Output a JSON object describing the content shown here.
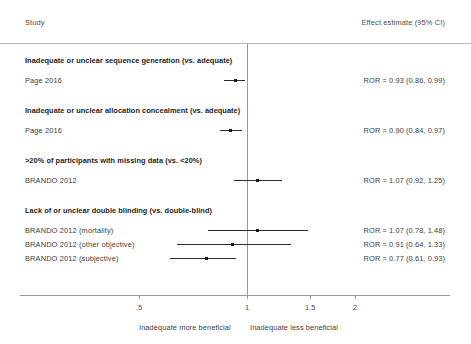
{
  "header": {
    "study_col": "Study",
    "estimate_col": "Effect estimate (95% CI)"
  },
  "footer": {
    "left": "Inadequate more beneficial",
    "right": "Inadequate less beneficial"
  },
  "chart_data": {
    "type": "scatter",
    "title": "",
    "xlabel": "",
    "ylabel": "",
    "scale": "log",
    "xlim": [
      0.42,
      2.35
    ],
    "reference_line": 1,
    "grid": false,
    "legend": "none",
    "xticks": [
      0.5,
      1,
      1.5,
      2
    ],
    "xticklabels": [
      ".5",
      "1",
      "1.5",
      "2"
    ],
    "effect_measure": "ROR",
    "sections": [
      {
        "heading": "Inadequate or unclear sequence generation (vs. adequate)",
        "rows": [
          {
            "study": "Page 2016",
            "estimate": 0.93,
            "ci_low": 0.86,
            "ci_high": 0.99,
            "text": "ROR = 0.93 (0.86, 0.99)"
          }
        ]
      },
      {
        "heading": "Inadequate or unclear allocation concealment (vs. adequate)",
        "rows": [
          {
            "study": "Page 2016",
            "estimate": 0.9,
            "ci_low": 0.84,
            "ci_high": 0.97,
            "text": "ROR = 0.90 (0.84, 0.97)"
          }
        ]
      },
      {
        "heading": ">20% of participants with missing data (vs. <20%)",
        "rows": [
          {
            "study": "BRANDO 2012",
            "estimate": 1.07,
            "ci_low": 0.92,
            "ci_high": 1.25,
            "text": "ROR = 1.07 (0.92, 1.25)"
          }
        ]
      },
      {
        "heading": "Lack of or unclear double blinding (vs. double-blind)",
        "rows": [
          {
            "study": "BRANDO 2012 (mortality)",
            "estimate": 1.07,
            "ci_low": 0.78,
            "ci_high": 1.48,
            "text": "ROR = 1.07 (0.78, 1.48)"
          },
          {
            "study": "BRANDO 2012 (other objective)",
            "estimate": 0.91,
            "ci_low": 0.64,
            "ci_high": 1.33,
            "text": "ROR = 0.91 (0.64, 1.33)"
          },
          {
            "study": "BRANDO 2012 (subjective)",
            "estimate": 0.77,
            "ci_low": 0.61,
            "ci_high": 0.93,
            "text": "ROR = 0.77 (0.61, 0.93)"
          }
        ]
      }
    ]
  }
}
